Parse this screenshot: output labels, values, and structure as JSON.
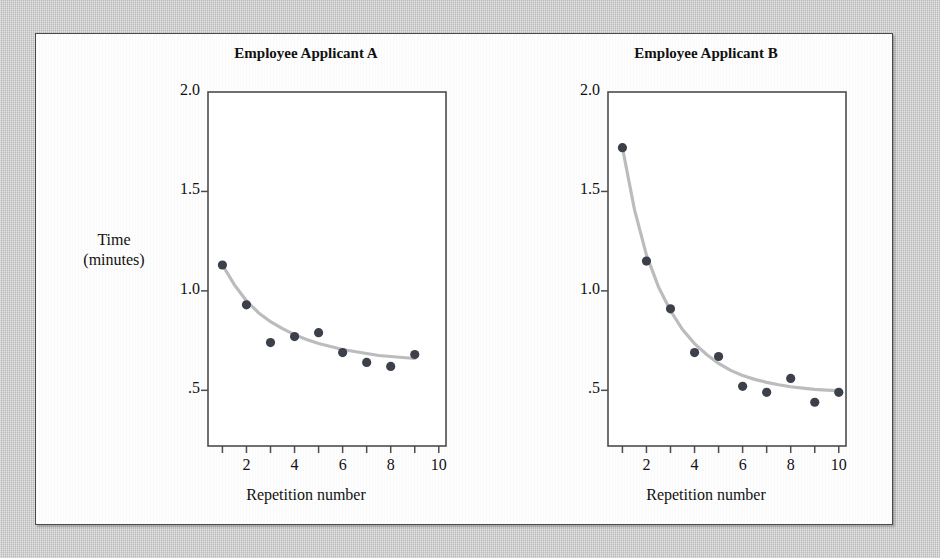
{
  "figure": {
    "background_color": "#c9c9c9",
    "panel_color": "#fdfdfd",
    "panel_border_color": "#4a4a4a",
    "point_color": "#3b404b",
    "curve_color": "#bcbcbc",
    "y_axis_label_line1": "Time",
    "y_axis_label_line2": "(minutes)"
  },
  "chart_data": [
    {
      "type": "scatter",
      "title": "Employee Applicant A",
      "xlabel": "Repetition number",
      "ylabel": "Time (minutes)",
      "xlim": [
        0.4,
        10.3
      ],
      "ylim": [
        0.22,
        2.0
      ],
      "grid": false,
      "legend": "none",
      "x_ticks": [
        1,
        2,
        3,
        4,
        5,
        6,
        7,
        8,
        9,
        10
      ],
      "x_tick_labels": [
        "",
        "2",
        "",
        "4",
        "",
        "6",
        "",
        "8",
        "",
        "10"
      ],
      "y_ticks": [
        0.5,
        1.0,
        1.5,
        2.0
      ],
      "y_tick_labels": [
        ".5",
        "1.0",
        "1.5",
        "2.0"
      ],
      "x": [
        1,
        2,
        3,
        4,
        5,
        6,
        7,
        8,
        9
      ],
      "values": [
        1.13,
        0.93,
        0.74,
        0.77,
        0.79,
        0.69,
        0.64,
        0.62,
        0.68
      ],
      "fit_curve": {
        "description": "learning curve fit",
        "x": [
          1,
          1.5,
          2,
          2.5,
          3,
          3.5,
          4,
          4.5,
          5,
          5.5,
          6,
          6.5,
          7,
          7.5,
          8,
          8.5,
          9
        ],
        "y": [
          1.13,
          1.03,
          0.95,
          0.89,
          0.845,
          0.81,
          0.78,
          0.755,
          0.735,
          0.72,
          0.705,
          0.695,
          0.685,
          0.675,
          0.67,
          0.665,
          0.66
        ]
      }
    },
    {
      "type": "scatter",
      "title": "Employee Applicant B",
      "xlabel": "Repetition number",
      "ylabel": "Time (minutes)",
      "xlim": [
        0.4,
        10.3
      ],
      "ylim": [
        0.22,
        2.0
      ],
      "grid": false,
      "legend": "none",
      "x_ticks": [
        1,
        2,
        3,
        4,
        5,
        6,
        7,
        8,
        9,
        10
      ],
      "x_tick_labels": [
        "",
        "2",
        "",
        "4",
        "",
        "6",
        "",
        "8",
        "",
        "10"
      ],
      "y_ticks": [
        0.5,
        1.0,
        1.5,
        2.0
      ],
      "y_tick_labels": [
        ".5",
        "1.0",
        "1.5",
        "2.0"
      ],
      "x": [
        1,
        2,
        3,
        4,
        5,
        6,
        7,
        8,
        9,
        10
      ],
      "values": [
        1.72,
        1.15,
        0.91,
        0.69,
        0.67,
        0.52,
        0.49,
        0.56,
        0.44,
        0.49
      ],
      "fit_curve": {
        "description": "learning curve fit",
        "x": [
          1,
          1.5,
          2,
          2.5,
          3,
          3.5,
          4,
          4.5,
          5,
          5.5,
          6,
          6.5,
          7,
          7.5,
          8,
          8.5,
          9,
          9.5,
          10
        ],
        "y": [
          1.72,
          1.41,
          1.18,
          1.02,
          0.9,
          0.805,
          0.735,
          0.68,
          0.635,
          0.6,
          0.575,
          0.555,
          0.54,
          0.528,
          0.518,
          0.511,
          0.505,
          0.501,
          0.498
        ]
      }
    }
  ]
}
